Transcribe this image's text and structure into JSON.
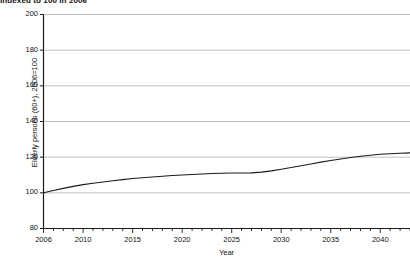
{
  "chart_data": {
    "type": "line",
    "title": "Indexed to 100 in 2006",
    "xlabel": "Year",
    "ylabel": "Elderly persons (60+), 2006=100",
    "grid": true,
    "legend": "none",
    "xlim": [
      2006,
      2043
    ],
    "ylim": [
      80,
      200
    ],
    "y_ticks": [
      80,
      100,
      120,
      140,
      160,
      180,
      200
    ],
    "x_ticks": [
      2006,
      2010,
      2015,
      2020,
      2025,
      2030,
      2035,
      2040
    ],
    "x_minor_tick_step": 1,
    "line_color": "#1a1a1a",
    "grid_color": "#b0b0b0",
    "axis_color": "#1a1a1a",
    "series": [
      {
        "name": "Elderly persons (60+), 2006=100",
        "x": [
          2006,
          2007,
          2008,
          2009,
          2010,
          2011,
          2012,
          2013,
          2014,
          2015,
          2016,
          2017,
          2018,
          2019,
          2020,
          2021,
          2022,
          2023,
          2024,
          2025,
          2026,
          2027,
          2028,
          2029,
          2030,
          2031,
          2032,
          2033,
          2034,
          2035,
          2036,
          2037,
          2038,
          2039,
          2040,
          2041,
          2042,
          2043
        ],
        "values": [
          100.0,
          101.3,
          102.5,
          103.6,
          104.6,
          105.4,
          106.1,
          106.8,
          107.4,
          108.0,
          108.5,
          108.9,
          109.3,
          109.7,
          110.0,
          110.3,
          110.6,
          110.8,
          111.0,
          111.1,
          111.1,
          111.2,
          111.6,
          112.3,
          113.2,
          114.2,
          115.2,
          116.2,
          117.2,
          118.1,
          119.0,
          119.8,
          120.5,
          121.1,
          121.6,
          121.9,
          122.2,
          122.4
        ]
      }
    ]
  }
}
